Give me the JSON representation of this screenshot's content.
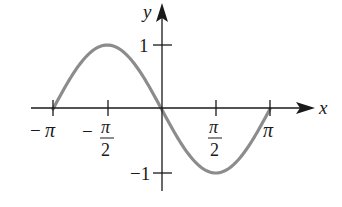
{
  "chart_data": {
    "type": "line",
    "title": "",
    "function": "y = -sin(x)",
    "xlabel": "x",
    "ylabel": "y",
    "xlim": [
      -3.14159,
      3.14159
    ],
    "ylim": [
      -1,
      1
    ],
    "grid": false,
    "legend": null,
    "x_ticks": [
      {
        "value": -3.14159,
        "label_num": "π",
        "label_den": "",
        "sign": "−"
      },
      {
        "value": -1.5708,
        "label_num": "π",
        "label_den": "2",
        "sign": "−"
      },
      {
        "value": 1.5708,
        "label_num": "π",
        "label_den": "2",
        "sign": ""
      },
      {
        "value": 3.14159,
        "label_num": "π",
        "label_den": "",
        "sign": ""
      }
    ],
    "y_ticks": [
      {
        "value": 1,
        "label": "1"
      },
      {
        "value": -1,
        "label": "−1"
      }
    ],
    "series": [
      {
        "name": "-sin(x)",
        "color": "#8c8c8c",
        "x": [
          -3.14159,
          -2.35619,
          -1.5708,
          -0.7854,
          0,
          0.7854,
          1.5708,
          2.35619,
          3.14159
        ],
        "y": [
          0,
          0.7071,
          1,
          0.7071,
          0,
          -0.7071,
          -1,
          -0.7071,
          0
        ]
      }
    ]
  },
  "colors": {
    "axis": "#1a1a1a",
    "curve": "#8c8c8c",
    "background": "#ffffff"
  }
}
